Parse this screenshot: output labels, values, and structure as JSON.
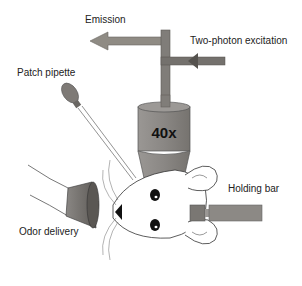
{
  "labels": {
    "emission": "Emission",
    "excitation": "Two-photon excitation",
    "patch_pipette": "Patch pipette",
    "objective_mag": "40x",
    "holding_bar": "Holding bar",
    "odor_delivery": "Odor delivery"
  },
  "colors": {
    "emission_arrow": "#8f8b84",
    "excitation_arrow": "#6f6c68",
    "objective": "#8a8784",
    "objective_dark": "#76736f",
    "pipette_bulb": "#7e7a76",
    "odor_cone": "#7b7874",
    "holding_bar": "#8c8985",
    "outline": "#333333"
  }
}
